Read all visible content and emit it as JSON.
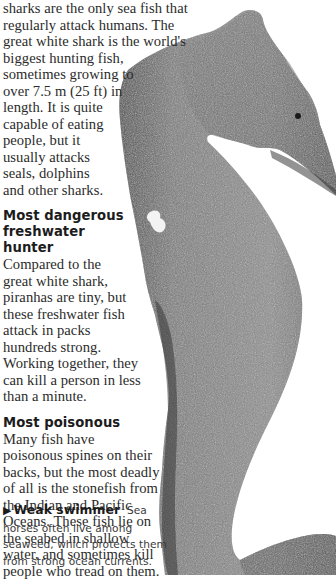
{
  "intro": {
    "lines": [
      "sharks are the only sea fish that",
      "regularly attack humans. The",
      "great white shark is the world's",
      "biggest hunting fish,",
      "sometimes growing to",
      "over 7.5 m (25 ft) in",
      "length. It is quite",
      "capable of eating",
      "people, but it",
      "usually attacks",
      "seals, dolphins",
      "and other sharks."
    ]
  },
  "sections": [
    {
      "heading_lines": [
        "Most dangerous",
        "freshwater",
        "hunter"
      ],
      "body_lines": [
        "Compared to the",
        "great white shark,",
        "piranhas are tiny, but",
        "these freshwater fish",
        "attack in packs",
        "hundreds strong.",
        "Working together, they",
        "can kill a person in less",
        "than a minute."
      ]
    },
    {
      "heading_lines": [
        "Most poisonous"
      ],
      "body_lines": [
        "Many fish have",
        "poisonous spines on their",
        "backs, but the most deadly",
        "of all is the stonefish from",
        "the Indian and Pacific",
        "Oceans. These fish lie on",
        "the seabed in shallow",
        "water, and sometimes kill",
        "people who tread on them."
      ]
    }
  ],
  "caption": {
    "arrow_icon": "▶",
    "title": "Weak swimmer",
    "first_line_rest": "Sea",
    "lines": [
      "horses often live among",
      "seaweed, which protects them",
      "from strong ocean currents."
    ]
  },
  "image": {
    "subject": "seahorse-photo",
    "colors": {
      "dark": "#3a3a3a",
      "mid": "#7a7a7a",
      "light": "#b5b5b5"
    }
  }
}
